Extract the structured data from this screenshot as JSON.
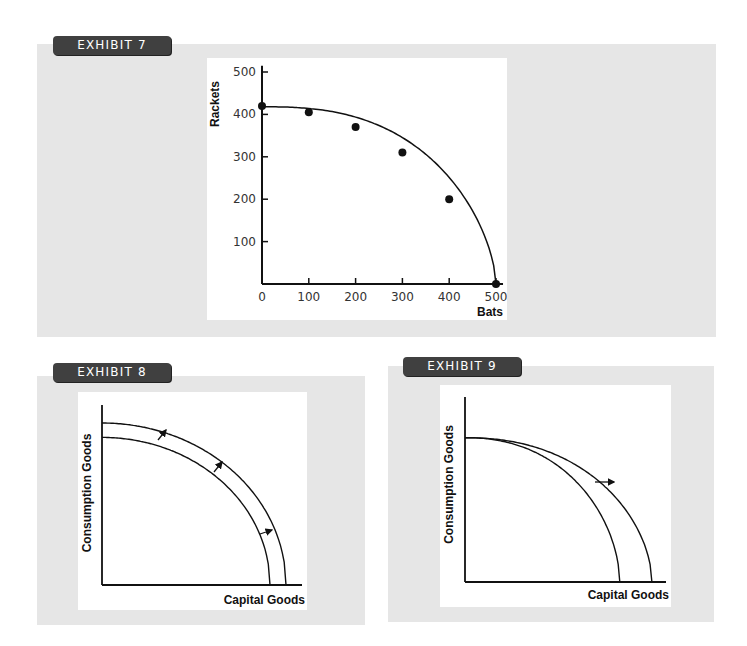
{
  "exhibits": [
    {
      "label": "EXHIBIT 7"
    },
    {
      "label": "EXHIBIT 8"
    },
    {
      "label": "EXHIBIT 9"
    }
  ],
  "chart_data": [
    {
      "id": "exhibit-7",
      "type": "line",
      "title": "EXHIBIT 7",
      "xlabel": "Bats",
      "ylabel": "Rackets",
      "x": [
        0,
        100,
        200,
        300,
        400,
        500
      ],
      "series": [
        {
          "name": "Production possibilities frontier",
          "values": [
            420,
            405,
            370,
            310,
            200,
            0
          ]
        }
      ],
      "xticks": [
        "0",
        "100",
        "200",
        "300",
        "400",
        "500"
      ],
      "yticks": [
        "100",
        "200",
        "300",
        "400",
        "500"
      ],
      "xlim": [
        0,
        500
      ],
      "ylim": [
        0,
        500
      ],
      "grid": false,
      "markers": true
    },
    {
      "id": "exhibit-8",
      "type": "line",
      "title": "EXHIBIT 8",
      "xlabel": "Capital Goods",
      "ylabel": "Consumption Goods",
      "description": "Parallel outward shift of production possibilities curve",
      "series": [
        {
          "name": "Original PPC",
          "x_intercept": 0.84,
          "y_intercept": 0.82
        },
        {
          "name": "Shifted PPC",
          "x_intercept": 0.92,
          "y_intercept": 0.9
        }
      ],
      "annotations": [
        "three arrows pointing outward from inner curve to outer curve"
      ],
      "grid": false
    },
    {
      "id": "exhibit-9",
      "type": "line",
      "title": "EXHIBIT 9",
      "xlabel": "Capital Goods",
      "ylabel": "Consumption Goods",
      "description": "Production possibilities curve pivots outward along capital goods axis; consumption intercept unchanged",
      "series": [
        {
          "name": "Original PPC",
          "x_intercept": 0.77,
          "y_intercept": 0.78
        },
        {
          "name": "Shifted PPC",
          "x_intercept": 0.93,
          "y_intercept": 0.78
        }
      ],
      "annotations": [
        "one arrow pointing right between curves"
      ],
      "grid": false
    }
  ]
}
